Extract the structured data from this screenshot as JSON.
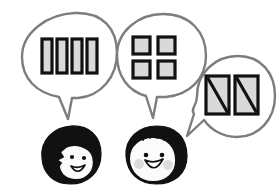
{
  "illustration": {
    "title": "Three speech bubbles with block diagrams above two cartoon faces",
    "background_color": "#ffffff",
    "outline_color": "#7d7d7d",
    "block_fill_color": "#d9d9d9",
    "block_stroke_color": "#111111",
    "hair_color": "#111111",
    "skin_color": "#fbfbfb",
    "blush_color": "#dcdcdc"
  },
  "bubbles": [
    {
      "id": "bubble-left",
      "shape": "ellipse",
      "tail_direction": "down",
      "content_kind": "vertical-bars",
      "content_count": 4,
      "content_label": "four vertical bars"
    },
    {
      "id": "bubble-middle",
      "shape": "ellipse",
      "tail_direction": "down",
      "content_kind": "square-grid",
      "content_count": 4,
      "content_label": "two by two grid of squares"
    },
    {
      "id": "bubble-right",
      "shape": "circle",
      "tail_direction": "left",
      "content_kind": "diagonal-split-rectangles",
      "content_count": 2,
      "content_label": "two rectangles split by a diagonal"
    }
  ],
  "faces": [
    {
      "id": "face-left",
      "hairstyle": "long black bob covering left side",
      "expression": "smiling",
      "has_blush": false
    },
    {
      "id": "face-right",
      "hairstyle": "short black bowl cut",
      "expression": "open smile",
      "has_blush": true
    }
  ]
}
